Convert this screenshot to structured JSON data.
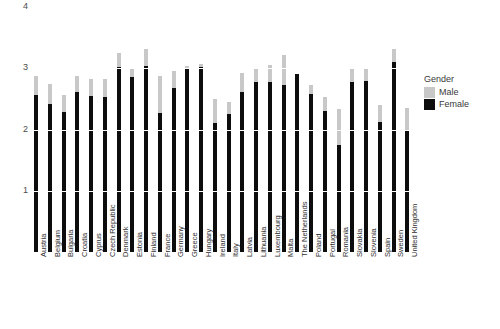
{
  "chart_data": {
    "type": "bar",
    "title": "",
    "subtitle": "",
    "xlabel": "",
    "ylabel": "",
    "ylim": [
      0,
      4
    ],
    "yticks": [
      1,
      2,
      3,
      4
    ],
    "ytick_labels": [
      "1",
      "2",
      "3",
      "4"
    ],
    "grid": true,
    "grid_color": "#ffffff",
    "legend_position": "right",
    "legend_title": "Gender",
    "categories": [
      "Austria",
      "Belgium",
      "Bulgaria",
      "Croatia",
      "Cyprus",
      "Czech Republic",
      "Denmark",
      "Estonia",
      "Finland",
      "France",
      "Germany",
      "Greece",
      "Hungary",
      "Ireland",
      "Italy",
      "Latvia",
      "Lithuania",
      "Luxembourg",
      "Malta",
      "The Netherlands",
      "Poland",
      "Portugal",
      "Romania",
      "Slovakia",
      "Slovenia",
      "Spain",
      "Sweden",
      "United Kingdom"
    ],
    "series": [
      {
        "name": "Male",
        "color": "#c8c8c8",
        "values": [
          2.87,
          2.74,
          2.57,
          2.87,
          2.82,
          2.83,
          3.25,
          2.98,
          3.32,
          2.88,
          2.95,
          3.03,
          3.07,
          2.5,
          2.45,
          2.92,
          3.0,
          3.05,
          3.22,
          2.8,
          2.72,
          2.53,
          2.33,
          2.98,
          3.0,
          2.4,
          3.32,
          2.35
        ]
      },
      {
        "name": "Female",
        "color": "#0d0d0d",
        "values": [
          2.57,
          2.42,
          2.28,
          2.62,
          2.55,
          2.53,
          3.02,
          2.85,
          3.03,
          2.27,
          2.68,
          3.0,
          3.02,
          2.1,
          2.25,
          2.62,
          2.77,
          2.78,
          2.72,
          2.9,
          2.58,
          2.3,
          1.75,
          2.78,
          2.8,
          2.13,
          3.1,
          1.98
        ]
      }
    ]
  }
}
